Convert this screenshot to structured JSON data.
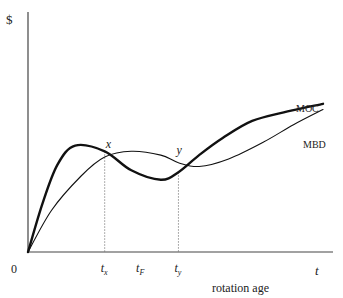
{
  "chart_data": {
    "type": "line",
    "title": "",
    "xlabel": "rotation age",
    "ylabel": "$",
    "x_axis_symbol": "t",
    "origin_label": "0",
    "xlim": [
      0,
      10
    ],
    "ylim": [
      0,
      10
    ],
    "grid": false,
    "legend": "inline-labels-right",
    "series": [
      {
        "name": "MOC",
        "style": "thick",
        "x": [
          0,
          0.5,
          1.0,
          1.6,
          2.6,
          3.5,
          4.5,
          5.1,
          5.8,
          6.6,
          7.6,
          8.8,
          10.0
        ],
        "y": [
          0,
          2.6,
          4.6,
          5.6,
          5.3,
          4.3,
          3.8,
          4.2,
          5.1,
          6.0,
          6.9,
          7.4,
          7.8
        ]
      },
      {
        "name": "MBD",
        "style": "thin",
        "x": [
          0,
          0.8,
          1.8,
          2.6,
          3.5,
          4.5,
          5.1,
          5.8,
          6.8,
          8.0,
          9.0,
          10.0
        ],
        "y": [
          0,
          2.2,
          4.0,
          5.0,
          5.3,
          5.1,
          4.7,
          4.5,
          4.9,
          5.8,
          6.7,
          7.5
        ]
      }
    ],
    "annotations": [
      {
        "type": "point-label",
        "text": "x",
        "x": 2.6,
        "y": 5.0
      },
      {
        "type": "point-label",
        "text": "y",
        "x": 5.1,
        "y": 4.7
      }
    ],
    "vlines": [
      {
        "x": 2.6,
        "label": "t",
        "subscript": "x",
        "style": "dotted"
      },
      {
        "x": 5.1,
        "label": "t",
        "subscript": "y",
        "style": "dotted"
      }
    ],
    "tick_labels": [
      {
        "x": 3.8,
        "label": "t",
        "subscript": "F"
      }
    ]
  }
}
